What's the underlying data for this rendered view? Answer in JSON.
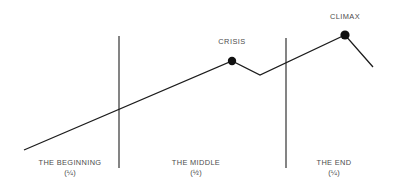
{
  "chart_data": {
    "type": "line",
    "title": "",
    "subtitle": "",
    "xlabel": "",
    "ylabel": "",
    "xlim": [
      0,
      393
    ],
    "ylim": [
      189,
      0
    ],
    "grid": false,
    "legend": null,
    "series": [
      {
        "name": "plot-arc",
        "color": "#1c1c1c",
        "points": [
          {
            "x": 24,
            "y": 150,
            "label": ""
          },
          {
            "x": 232,
            "y": 61,
            "label": "CRISIS"
          },
          {
            "x": 260,
            "y": 75,
            "label": ""
          },
          {
            "x": 345,
            "y": 35,
            "label": "CLIMAX"
          },
          {
            "x": 373,
            "y": 67,
            "label": ""
          }
        ]
      }
    ],
    "markers": [
      {
        "name": "crisis",
        "x": 232,
        "y": 61,
        "r": 4.2,
        "color": "#111111",
        "label": "CRISIS"
      },
      {
        "name": "climax",
        "x": 345,
        "y": 35,
        "r": 4.6,
        "color": "#111111",
        "label": "CLIMAX"
      }
    ],
    "dividers": [
      {
        "name": "beginning-middle-divider",
        "x": 119,
        "y1": 36,
        "y2": 168
      },
      {
        "name": "middle-end-divider",
        "x": 286,
        "y1": 38,
        "y2": 168
      }
    ],
    "annotations": [
      {
        "name": "crisis-label",
        "text": "CRISIS",
        "x": 232,
        "y": 42
      },
      {
        "name": "climax-label",
        "text": "CLIMAX",
        "x": 345,
        "y": 17
      }
    ]
  },
  "diagram": {
    "point_labels": [
      {
        "id": "crisis",
        "text": "CRISIS",
        "center_x": 232,
        "top": 37
      },
      {
        "id": "climax",
        "text": "CLIMAX",
        "center_x": 345,
        "top": 12
      }
    ],
    "acts": [
      {
        "id": "beginning",
        "name": "THE BEGINNING",
        "fraction": "(¼)",
        "center_x": 70,
        "top": 158
      },
      {
        "id": "middle",
        "name": "THE MIDDLE",
        "fraction": "(½)",
        "center_x": 196,
        "top": 158
      },
      {
        "id": "end",
        "name": "THE END",
        "fraction": "(¼)",
        "center_x": 334,
        "top": 158
      }
    ],
    "colors": {
      "line": "#1c1c1c",
      "divider": "#3b3b3b",
      "marker": "#111111",
      "text": "#4c4c4c",
      "background": "#ffffff"
    }
  }
}
